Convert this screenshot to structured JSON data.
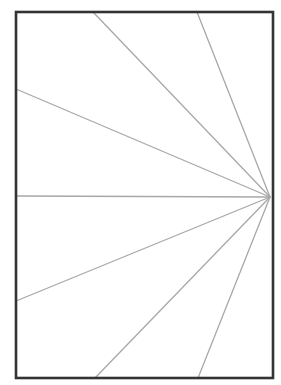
{
  "diagram": {
    "canvas": {
      "width": 281,
      "height": 385,
      "background": "#ffffff"
    },
    "frame": {
      "x1": 16,
      "y1": 12,
      "x2": 273,
      "y2": 378,
      "stroke": "#333333",
      "stroke_width": 2.6
    },
    "focal_point": {
      "x": 270,
      "y": 197
    },
    "rays": {
      "stroke": "#a8a8a8",
      "stroke_width": 1.3,
      "endpoints": [
        {
          "edge": "top",
          "x": 93,
          "y": 12
        },
        {
          "edge": "top",
          "x": 197,
          "y": 12
        },
        {
          "edge": "left",
          "x": 16,
          "y": 89
        },
        {
          "edge": "left",
          "x": 16,
          "y": 196
        },
        {
          "edge": "left",
          "x": 16,
          "y": 301
        },
        {
          "edge": "bottom",
          "x": 95,
          "y": 378
        },
        {
          "edge": "bottom",
          "x": 198,
          "y": 378
        }
      ]
    }
  }
}
